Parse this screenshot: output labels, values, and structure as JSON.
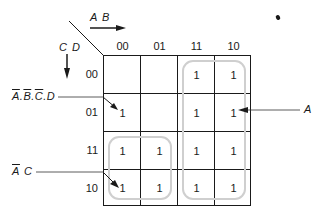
{
  "diagram": {
    "type": "karnaugh-map",
    "column_variables": "A B",
    "row_variables": "C D",
    "column_headers": [
      "00",
      "01",
      "11",
      "10"
    ],
    "row_headers": [
      "00",
      "01",
      "11",
      "10"
    ],
    "cells": [
      [
        "",
        "",
        "1",
        "1"
      ],
      [
        "1",
        "",
        "1",
        "1"
      ],
      [
        "1",
        "1",
        "1",
        "1"
      ],
      [
        "1",
        "1",
        "1",
        "1"
      ]
    ],
    "annotations": {
      "minterm_label": {
        "parts": [
          "A",
          ".",
          "B",
          ".",
          "C",
          ".D"
        ],
        "text": "Ā.B̄.C̄.D"
      },
      "group_a_label": "A",
      "group_ac_label": {
        "a": "A",
        "c": " C",
        "text": "Ā C"
      }
    },
    "groups": [
      {
        "name": "A",
        "cells": "columns 11,10 all rows"
      },
      {
        "name": "ĀC",
        "cells": "columns 00,01 rows 11,10"
      }
    ],
    "colors": {
      "lines": "#1a1a1a",
      "loops": "#cfcfcf"
    }
  }
}
